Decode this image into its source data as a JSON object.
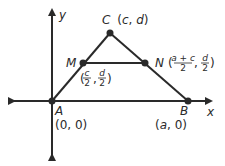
{
  "diagram": {
    "axes": {
      "x_label": "x",
      "y_label": "y"
    },
    "points": {
      "A": {
        "name": "A",
        "coord": "(0, 0)"
      },
      "B": {
        "name": "B",
        "coord_open": "(",
        "coord_var": "a",
        "coord_close": ", 0)"
      },
      "C": {
        "name": "C",
        "coord_open": "(",
        "coord_x": "c",
        "coord_sep": ", ",
        "coord_y": "d",
        "coord_close": ")"
      },
      "M": {
        "name": "M",
        "x_num": "c",
        "x_den": "2",
        "y_num": "d",
        "y_den": "2"
      },
      "N": {
        "name": "N",
        "x_num": "a + c",
        "x_den": "2",
        "y_num": "d",
        "y_den": "2"
      }
    },
    "punct": {
      "open": "(",
      "comma": ",",
      "close": ")"
    },
    "colors": {
      "stroke": "#2a2a2a",
      "background": "#ffffff"
    }
  }
}
